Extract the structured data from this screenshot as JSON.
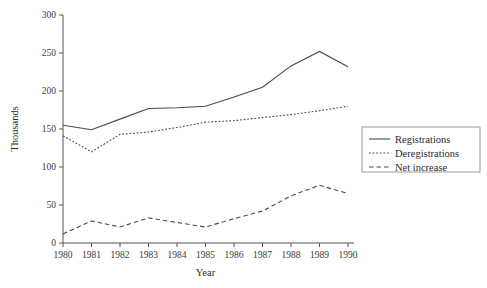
{
  "chart_data": {
    "type": "line",
    "title": "",
    "xlabel": "Year",
    "ylabel": "Thousands",
    "x": [
      1980,
      1981,
      1982,
      1983,
      1984,
      1985,
      1986,
      1987,
      1988,
      1989,
      1990
    ],
    "xtick_labels": [
      "1980",
      "1981",
      "1982",
      "1983",
      "1984",
      "1985",
      "1986",
      "1987",
      "1988",
      "1989",
      "1990"
    ],
    "ytick_labels": [
      "0",
      "50",
      "100",
      "150",
      "200",
      "250",
      "300"
    ],
    "yticks": [
      0,
      50,
      100,
      150,
      200,
      250,
      300
    ],
    "xlim": [
      1980,
      1990
    ],
    "ylim": [
      0,
      300
    ],
    "grid": false,
    "legend_position": "right",
    "series": [
      {
        "name": "Registrations",
        "style": "solid",
        "color": "#4a4a4a",
        "values": [
          155,
          149,
          163,
          177,
          178,
          180,
          192,
          205,
          233,
          252,
          232
        ]
      },
      {
        "name": "Deregistrations",
        "style": "dotted",
        "color": "#4a4a4a",
        "values": [
          141,
          120,
          143,
          146,
          152,
          159,
          161,
          165,
          169,
          174,
          180
        ]
      },
      {
        "name": "Net increase",
        "style": "dashed",
        "color": "#4a4a4a",
        "values": [
          12,
          29,
          21,
          33,
          27,
          21,
          32,
          42,
          62,
          76,
          65
        ]
      }
    ]
  },
  "legend": {
    "items": [
      {
        "label": "Registrations",
        "style": "solid"
      },
      {
        "label": "Deregistrations",
        "style": "dotted"
      },
      {
        "label": "Net increase",
        "style": "dashed"
      }
    ]
  }
}
